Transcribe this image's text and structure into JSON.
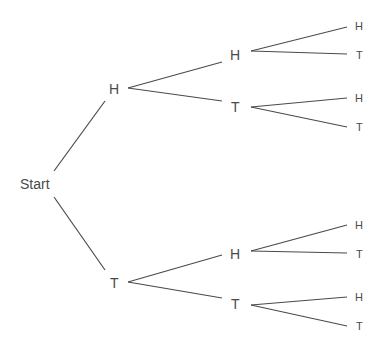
{
  "diagram": {
    "type": "probability-tree",
    "colors": {
      "line": "#4a4a4a",
      "text": "#4a4a4a",
      "background": "#ffffff"
    },
    "root": {
      "label": "Start"
    },
    "level1": [
      {
        "label": "H"
      },
      {
        "label": "T"
      }
    ],
    "level2": [
      {
        "label": "H",
        "parent": "H"
      },
      {
        "label": "T",
        "parent": "H"
      },
      {
        "label": "H",
        "parent": "T"
      },
      {
        "label": "T",
        "parent": "T"
      }
    ],
    "level3": [
      {
        "label": "H",
        "parent": "HH"
      },
      {
        "label": "T",
        "parent": "HH"
      },
      {
        "label": "H",
        "parent": "HT"
      },
      {
        "label": "T",
        "parent": "HT"
      },
      {
        "label": "H",
        "parent": "TH"
      },
      {
        "label": "T",
        "parent": "TH"
      },
      {
        "label": "H",
        "parent": "TT"
      },
      {
        "label": "T",
        "parent": "TT"
      }
    ]
  }
}
